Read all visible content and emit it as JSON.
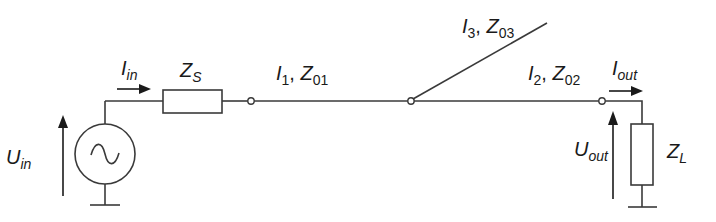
{
  "diagram": {
    "type": "transmission-line circuit",
    "line_color": "#3a3a3a",
    "labels": {
      "source_voltage": {
        "main": "U",
        "sub": "in"
      },
      "input_current": {
        "main": "I",
        "sub": "in"
      },
      "source_impedance": {
        "main": "Z",
        "sub": "S"
      },
      "line1": {
        "i_main": "I",
        "i_sub": "1",
        "sep": ", ",
        "z_main": "Z",
        "z_sub": "01"
      },
      "line2": {
        "i_main": "I",
        "i_sub": "2",
        "sep": ", ",
        "z_main": "Z",
        "z_sub": "02"
      },
      "line3": {
        "i_main": "I",
        "i_sub": "3",
        "sep": ", ",
        "z_main": "Z",
        "z_sub": "03"
      },
      "output_current": {
        "main": "I",
        "sub": "out"
      },
      "output_voltage": {
        "main": "U",
        "sub": "out"
      },
      "load_impedance": {
        "main": "Z",
        "sub": "L"
      }
    },
    "components": [
      {
        "name": "ac-voltage-source",
        "symbol": "~"
      },
      {
        "name": "source-impedance",
        "label": "Z_S"
      },
      {
        "name": "line-section-1",
        "label": "I_1, Z_01"
      },
      {
        "name": "stub-line-3",
        "label": "I_3, Z_03"
      },
      {
        "name": "line-section-2",
        "label": "I_2, Z_02"
      },
      {
        "name": "load-impedance",
        "label": "Z_L"
      }
    ]
  }
}
